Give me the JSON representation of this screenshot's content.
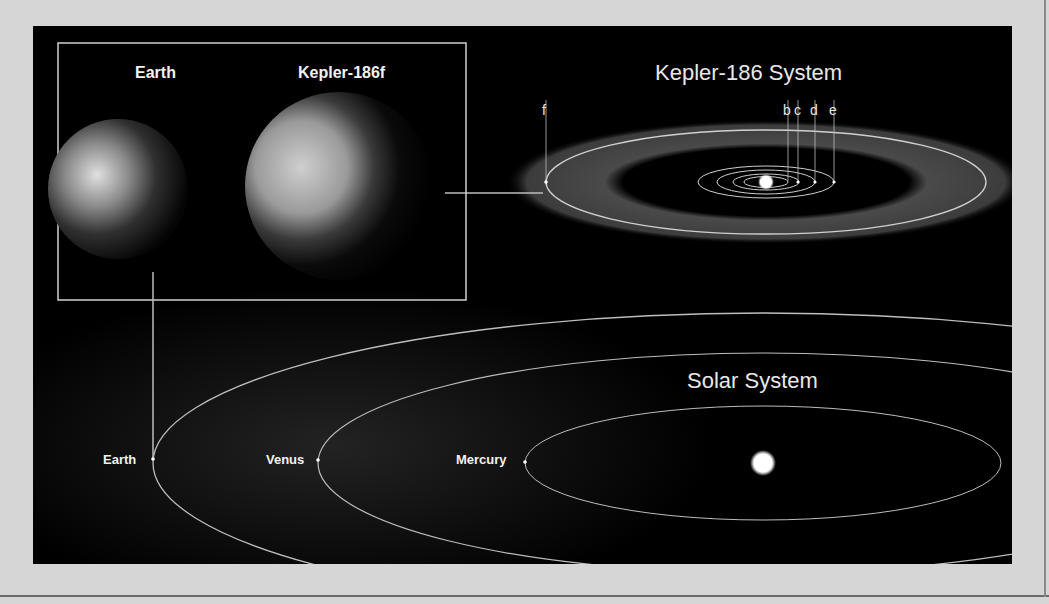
{
  "comparison_box": {
    "earth_label": "Earth",
    "kepler_label": "Kepler-186f"
  },
  "kepler_system": {
    "title": "Kepler-186 System",
    "planets": [
      "b",
      "c",
      "d",
      "e",
      "f"
    ],
    "planet_labels": {
      "b": "b",
      "c": "c",
      "d": "d",
      "e": "e",
      "f": "f"
    }
  },
  "solar_system": {
    "title": "Solar System",
    "orbit_labels": {
      "earth": "Earth",
      "venus": "Venus",
      "mercury": "Mercury"
    }
  },
  "colors": {
    "background": "#d6d6d6",
    "panel": "#000000",
    "orbit_line": "#c8c8c8",
    "habitable_zone": "#3a3a3a",
    "text": "#f2f2f2"
  }
}
